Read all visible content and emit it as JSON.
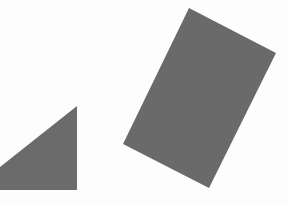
{
  "canvas": {
    "width": 287,
    "height": 205,
    "background": "#fdfdfd"
  },
  "shapes": [
    {
      "id": "triangle",
      "type": "right-triangle",
      "fill": "#6b6b6b",
      "points": "77,106 77,190 0,190 0,167"
    },
    {
      "id": "rectangle",
      "type": "rotated-rectangle",
      "fill": "#6a6a6a",
      "points": "189,8 276,53 209,188 123,144"
    }
  ]
}
